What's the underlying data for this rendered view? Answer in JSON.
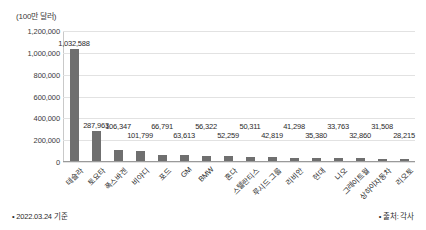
{
  "chart_data": {
    "type": "bar",
    "title": "",
    "subtitle": "",
    "xlabel": "",
    "ylabel": "(100만 달러)",
    "ylim": [
      0,
      1200000
    ],
    "ytick_labels": [
      "1,200,000",
      "1,000,000",
      "800,000",
      "600,000",
      "400,000",
      "200,000",
      "0"
    ],
    "ytick_values": [
      1200000,
      1000000,
      800000,
      600000,
      400000,
      200000,
      0
    ],
    "grid": true,
    "legend": "none",
    "bar_color": "#6f6f6f",
    "categories": [
      "테슬라",
      "토요타",
      "폭스바겐",
      "비야디",
      "포드",
      "GM",
      "BMW",
      "혼다",
      "스텔란티스",
      "루시드 그룹",
      "리비안",
      "현대",
      "니오",
      "그레이트월",
      "상하이자동차",
      "리오토"
    ],
    "values": [
      1032588,
      287963,
      106347,
      101799,
      66791,
      63613,
      56322,
      52259,
      50311,
      42819,
      41298,
      35380,
      33763,
      32860,
      31508,
      28215
    ],
    "value_labels": [
      "1,032,588",
      "287,963",
      "106,347",
      "101,799",
      "66,791",
      "63,613",
      "56,322",
      "52,259",
      "50,311",
      "42,819",
      "41,298",
      "35,380",
      "33,763",
      "32,860",
      "31,508",
      "28,215"
    ]
  },
  "footer": {
    "left_note": "• 2022.03.24 기준",
    "right_note": "• 출처: 각사"
  }
}
